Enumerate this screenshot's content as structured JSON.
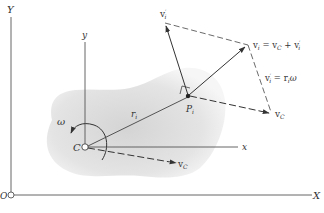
{
  "diagram": {
    "colors": {
      "ink": "#444444",
      "body_fill": "#d9d9d9",
      "body_edge": "#f2f2f2",
      "background": "#ffffff"
    },
    "axes": {
      "fixed_x_label": "X",
      "fixed_y_label": "Y",
      "origin_label": "O",
      "body_x_label": "x",
      "body_y_label": "y"
    },
    "points": {
      "center_label": "C",
      "particle_label": "P",
      "particle_sub": "i"
    },
    "vectors": {
      "position_label": "r",
      "position_sub": "i",
      "vc_label": "v",
      "vc_sub": "C",
      "vc_at_p_label": "v",
      "vc_at_p_sub": "C",
      "vi_prime_label": "v",
      "vi_prime_sub": "i",
      "vi_prime_sup": "′",
      "omega_label": "ω"
    },
    "equations": {
      "vi_eq": "v",
      "vi_eq_sub": "i",
      "vi_eq_rest1": " = v",
      "vi_eq_sub2": "C",
      "vi_eq_rest2": " + v",
      "vi_eq_sub3": "i",
      "vi_eq_sup3": "′",
      "vip_eq": "v",
      "vip_eq_sub": "i",
      "vip_eq_sup": "′",
      "vip_eq_rest": " = r",
      "vip_eq_sub2": "i",
      "vip_eq_rest2": "ω"
    }
  }
}
